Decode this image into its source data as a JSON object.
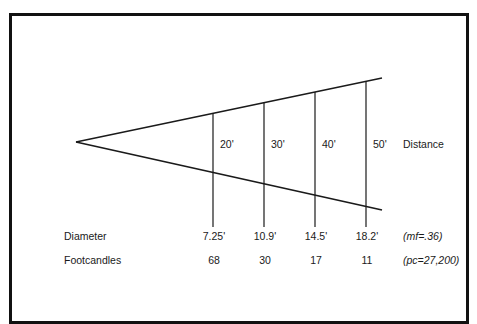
{
  "diagram": {
    "distance_label": "Distance",
    "distances": [
      "20'",
      "30'",
      "40'",
      "50'"
    ],
    "rows": [
      {
        "label": "Diameter",
        "values": [
          "7.25'",
          "10.9'",
          "14.5'",
          "18.2'"
        ],
        "note": "(mf=.36)"
      },
      {
        "label": "Footcandles",
        "values": [
          "68",
          "30",
          "17",
          "11"
        ],
        "note": "(pc=27,200)"
      }
    ],
    "colors": {
      "line": "#1a1a1a",
      "frame": "#111111",
      "background": "#ffffff"
    }
  }
}
